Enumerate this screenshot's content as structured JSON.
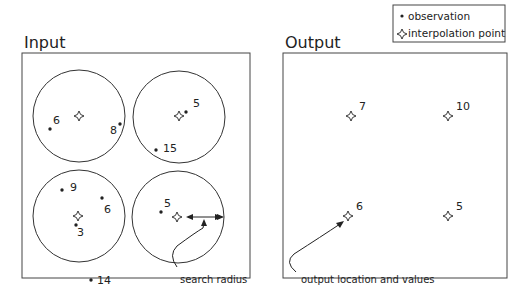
{
  "legend": {
    "observation_label": "observation",
    "interpolation_label": "interpolation point"
  },
  "input": {
    "title": "Input",
    "circles": [
      {
        "cx": 79,
        "cy": 116,
        "r": 46,
        "interp": [
          79,
          116
        ],
        "obs": [
          {
            "x": 50,
            "y": 129,
            "label": "6",
            "lx": 53,
            "ly": 124
          },
          {
            "x": 120,
            "y": 124,
            "label": "8",
            "lx": 110,
            "ly": 134
          }
        ]
      },
      {
        "cx": 179,
        "cy": 117,
        "r": 46,
        "interp": [
          179,
          116
        ],
        "obs": [
          {
            "x": 186,
            "y": 112,
            "label": "5",
            "lx": 193,
            "ly": 107
          },
          {
            "x": 156,
            "y": 150,
            "label": "15",
            "lx": 163,
            "ly": 152
          }
        ]
      },
      {
        "cx": 79,
        "cy": 216,
        "r": 46,
        "interp": [
          78,
          216
        ],
        "obs": [
          {
            "x": 62,
            "y": 190,
            "label": "9",
            "lx": 70,
            "ly": 191
          },
          {
            "x": 102,
            "y": 198,
            "label": "6",
            "lx": 104,
            "ly": 213
          },
          {
            "x": 76,
            "y": 225,
            "label": "3",
            "lx": 77,
            "ly": 236
          }
        ]
      },
      {
        "cx": 178,
        "cy": 217,
        "r": 46,
        "interp": [
          177,
          217
        ],
        "obs": [
          {
            "x": 161,
            "y": 212,
            "label": "5",
            "lx": 164,
            "ly": 207
          }
        ]
      }
    ],
    "stray_obs": [
      {
        "x": 91,
        "y": 280,
        "label": "14",
        "lx": 97,
        "ly": 284
      }
    ],
    "annotation": "search radius"
  },
  "output": {
    "title": "Output",
    "points": [
      {
        "x": 351,
        "y": 116,
        "label": "7"
      },
      {
        "x": 448,
        "y": 116,
        "label": "10"
      },
      {
        "x": 348,
        "y": 216,
        "label": "6"
      },
      {
        "x": 448,
        "y": 216,
        "label": "5"
      }
    ],
    "annotation": "output location and values"
  }
}
